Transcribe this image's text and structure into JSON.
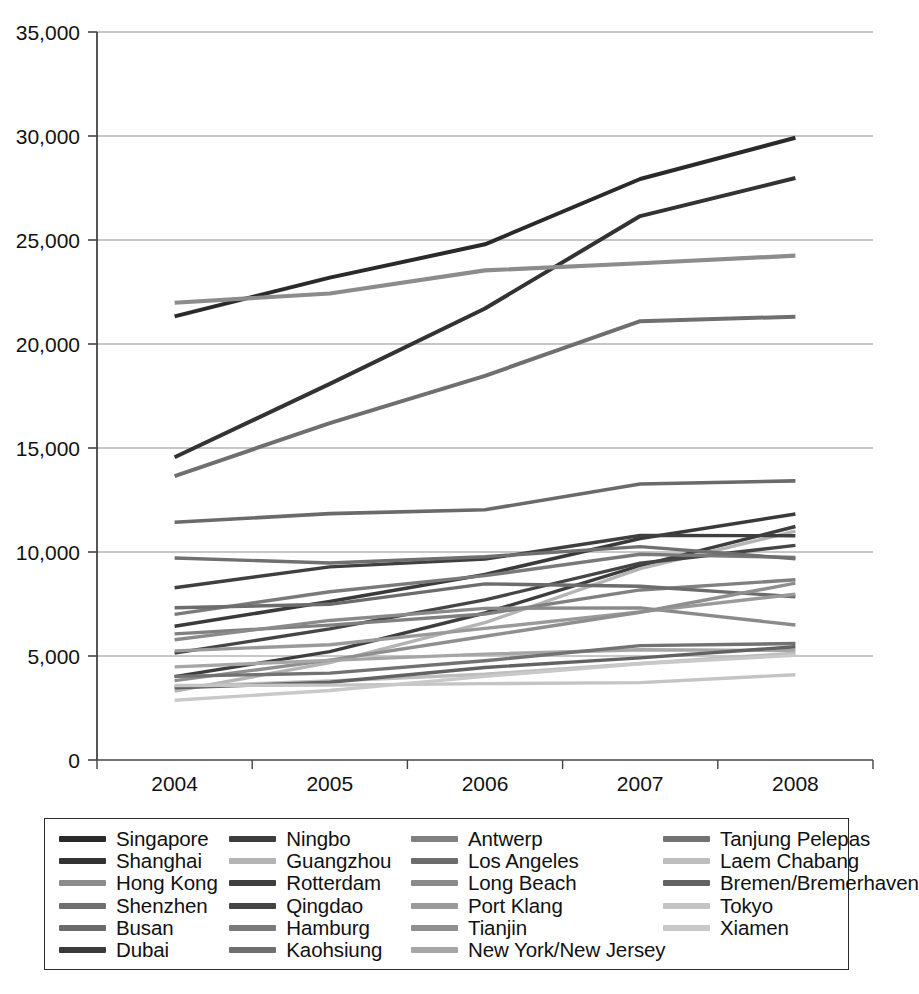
{
  "chart_data": {
    "type": "line",
    "title": "",
    "xlabel": "",
    "ylabel": "",
    "x": [
      "2004",
      "2005",
      "2006",
      "2007",
      "2008"
    ],
    "categories": [
      "2004",
      "2005",
      "2006",
      "2007",
      "2008"
    ],
    "ylim": [
      0,
      35000
    ],
    "y_ticks": [
      0,
      5000,
      10000,
      15000,
      20000,
      25000,
      30000,
      35000
    ],
    "y_tick_labels": [
      "0",
      "5,000",
      "10,000",
      "15,000",
      "20,000",
      "25,000",
      "30,000",
      "35,000"
    ],
    "grid": "horizontal",
    "legend_position": "bottom",
    "legend_columns": 4,
    "series": [
      {
        "name": "Singapore",
        "color": "#2a2a2a",
        "width": 4.0,
        "values": [
          21329,
          23192,
          24792,
          27932,
          29918
        ]
      },
      {
        "name": "Shanghai",
        "color": "#333333",
        "width": 4.0,
        "values": [
          14557,
          18084,
          21710,
          26150,
          27980
        ]
      },
      {
        "name": "Hong Kong",
        "color": "#8c8c8c",
        "width": 4.2,
        "values": [
          21984,
          22427,
          23539,
          23881,
          24248
        ]
      },
      {
        "name": "Shenzhen",
        "color": "#6f6f6f",
        "width": 4.0,
        "values": [
          13650,
          16197,
          18469,
          21099,
          21314
        ]
      },
      {
        "name": "Busan",
        "color": "#6a6a6a",
        "width": 3.6,
        "values": [
          11430,
          11843,
          12030,
          13270,
          13420
        ]
      },
      {
        "name": "Dubai",
        "color": "#3a3a3a",
        "width": 3.6,
        "values": [
          6429,
          7619,
          8923,
          10650,
          11827
        ]
      },
      {
        "name": "Ningbo",
        "color": "#3d3d3d",
        "width": 3.4,
        "values": [
          4006,
          5208,
          7068,
          9349,
          11226
        ]
      },
      {
        "name": "Guangzhou",
        "color": "#b4b4b4",
        "width": 3.4,
        "values": [
          3308,
          4685,
          6600,
          9200,
          11001
        ]
      },
      {
        "name": "Rotterdam",
        "color": "#3f3f3f",
        "width": 3.4,
        "values": [
          8281,
          9287,
          9655,
          10791,
          10784
        ]
      },
      {
        "name": "Qingdao",
        "color": "#454545",
        "width": 3.4,
        "values": [
          5140,
          6307,
          7702,
          9462,
          10320
        ]
      },
      {
        "name": "Hamburg",
        "color": "#7a7a7a",
        "width": 3.4,
        "values": [
          7003,
          8088,
          8862,
          9890,
          9737
        ]
      },
      {
        "name": "Kaohsiung",
        "color": "#707070",
        "width": 3.4,
        "values": [
          9714,
          9471,
          9775,
          10257,
          9677
        ]
      },
      {
        "name": "Antwerp",
        "color": "#808080",
        "width": 3.4,
        "values": [
          6064,
          6482,
          7019,
          8176,
          8663
        ]
      },
      {
        "name": "Los Angeles",
        "color": "#6c6c6c",
        "width": 3.4,
        "values": [
          7321,
          7485,
          8469,
          8355,
          7850
        ]
      },
      {
        "name": "Long Beach",
        "color": "#8a8a8a",
        "width": 3.4,
        "values": [
          5780,
          6710,
          7289,
          7312,
          6488
        ]
      },
      {
        "name": "Port Klang",
        "color": "#9a9a9a",
        "width": 3.4,
        "values": [
          5244,
          5544,
          6326,
          7120,
          7970
        ]
      },
      {
        "name": "Tianjin",
        "color": "#8f8f8f",
        "width": 3.4,
        "values": [
          3814,
          4801,
          5950,
          7103,
          8500
        ]
      },
      {
        "name": "New York/New Jersey",
        "color": "#a6a6a6",
        "width": 3.4,
        "values": [
          4478,
          4792,
          5092,
          5299,
          5265
        ]
      },
      {
        "name": "Tanjung Pelepas",
        "color": "#727272",
        "width": 3.4,
        "values": [
          4020,
          4177,
          4770,
          5500,
          5600
        ]
      },
      {
        "name": "Laem Chabang",
        "color": "#bdbdbd",
        "width": 3.4,
        "values": [
          3529,
          3800,
          4123,
          4642,
          5134
        ]
      },
      {
        "name": "Bremen/Bremerhaven",
        "color": "#626262",
        "width": 3.4,
        "values": [
          3469,
          3736,
          4450,
          4912,
          5448
        ]
      },
      {
        "name": "Tokyo",
        "color": "#c4c4c4",
        "width": 3.4,
        "values": [
          3580,
          3600,
          3670,
          3720,
          4100
        ]
      },
      {
        "name": "Xiamen",
        "color": "#c9c9c9",
        "width": 3.4,
        "values": [
          2872,
          3342,
          4019,
          4627,
          5035
        ]
      }
    ]
  },
  "legend": {
    "columns": [
      {
        "items": [
          "Singapore",
          "Shanghai",
          "Hong Kong",
          "Shenzhen",
          "Busan",
          "Dubai"
        ]
      },
      {
        "items": [
          "Ningbo",
          "Guangzhou",
          "Rotterdam",
          "Qingdao",
          "Hamburg",
          "Kaohsiung"
        ]
      },
      {
        "items": [
          "Antwerp",
          "Los Angeles",
          "Long Beach",
          "Port Klang",
          "Tianjin",
          "New York/New Jersey"
        ]
      },
      {
        "items": [
          "Tanjung Pelepas",
          "Laem Chabang",
          "Bremen/Bremerhaven",
          "Tokyo",
          "Xiamen"
        ]
      }
    ]
  },
  "axes": {
    "axis_color": "#444444",
    "grid_color": "#8f8f8f"
  }
}
